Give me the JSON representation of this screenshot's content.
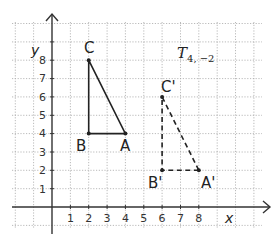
{
  "diagram": {
    "type": "coordinate-grid-translation",
    "transformation_label": "T",
    "transformation_subscript": "4, −2",
    "axes": {
      "x_label": "x",
      "y_label": "y",
      "x_ticks": [
        "1",
        "2",
        "3",
        "4",
        "5",
        "6",
        "7",
        "8"
      ],
      "y_ticks": [
        "1",
        "2",
        "3",
        "4",
        "5",
        "6",
        "7",
        "8"
      ]
    },
    "original_triangle": {
      "style": "solid",
      "points": [
        {
          "label": "A",
          "x": 4,
          "y": 4
        },
        {
          "label": "B",
          "x": 2,
          "y": 4
        },
        {
          "label": "C",
          "x": 2,
          "y": 8
        }
      ]
    },
    "image_triangle": {
      "style": "dashed",
      "points": [
        {
          "label": "A'",
          "x": 8,
          "y": 2
        },
        {
          "label": "B'",
          "x": 6,
          "y": 2
        },
        {
          "label": "C'",
          "x": 6,
          "y": 6
        }
      ]
    },
    "colors": {
      "grid": "#9a9a9a",
      "axes": "#333333",
      "triangle": "#222222"
    }
  }
}
